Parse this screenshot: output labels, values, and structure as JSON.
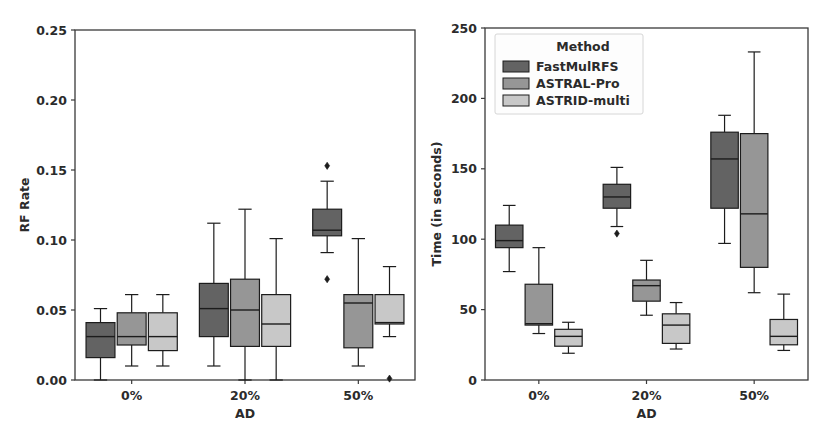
{
  "figure": {
    "width": 827,
    "height": 441,
    "background": "#ffffff",
    "panel_count": 2
  },
  "legend": {
    "title": "Method",
    "position": "upper-left-of-right-panel",
    "entries": [
      {
        "label": "FastMulRFS",
        "color": "#636363"
      },
      {
        "label": "ASTRAL-Pro",
        "color": "#969696"
      },
      {
        "label": "ASTRID-multi",
        "color": "#c8c8c8"
      }
    ]
  },
  "colors": {
    "fastmulrfs": "#636363",
    "astral_pro": "#969696",
    "astrid_multi": "#c8c8c8",
    "edge": "#1c1c1c",
    "axis": "#3a3a3a",
    "text": "#2b2b2b"
  },
  "chart_data": [
    {
      "type": "box",
      "panel": "left",
      "title": "",
      "xlabel": "AD",
      "ylabel": "RF Rate",
      "categories": [
        "0%",
        "20%",
        "50%"
      ],
      "ylim": [
        0.0,
        0.25
      ],
      "yticks": [
        0.0,
        0.05,
        0.1,
        0.15,
        0.2,
        0.25
      ],
      "ytick_labels": [
        "0.00",
        "0.05",
        "0.10",
        "0.15",
        "0.20",
        "0.25"
      ],
      "grid": false,
      "legend_shown": false,
      "series": [
        {
          "name": "FastMulRFS",
          "color": "#636363",
          "boxes": [
            {
              "category": "0%",
              "whisker_low": 0.0,
              "q1": 0.016,
              "median": 0.031,
              "q3": 0.041,
              "whisker_high": 0.051,
              "outliers": []
            },
            {
              "category": "20%",
              "whisker_low": 0.01,
              "q1": 0.031,
              "median": 0.051,
              "q3": 0.069,
              "whisker_high": 0.112,
              "outliers": []
            },
            {
              "category": "50%",
              "whisker_low": 0.091,
              "q1": 0.103,
              "median": 0.107,
              "q3": 0.122,
              "whisker_high": 0.142,
              "outliers": [
                0.153,
                0.072
              ]
            }
          ]
        },
        {
          "name": "ASTRAL-Pro",
          "color": "#969696",
          "boxes": [
            {
              "category": "0%",
              "whisker_low": 0.01,
              "q1": 0.025,
              "median": 0.031,
              "q3": 0.048,
              "whisker_high": 0.061,
              "outliers": []
            },
            {
              "category": "20%",
              "whisker_low": 0.0,
              "q1": 0.024,
              "median": 0.05,
              "q3": 0.072,
              "whisker_high": 0.122,
              "outliers": []
            },
            {
              "category": "50%",
              "whisker_low": 0.01,
              "q1": 0.023,
              "median": 0.055,
              "q3": 0.061,
              "whisker_high": 0.101,
              "outliers": []
            }
          ]
        },
        {
          "name": "ASTRID-multi",
          "color": "#c8c8c8",
          "boxes": [
            {
              "category": "0%",
              "whisker_low": 0.01,
              "q1": 0.021,
              "median": 0.031,
              "q3": 0.048,
              "whisker_high": 0.061,
              "outliers": []
            },
            {
              "category": "20%",
              "whisker_low": 0.0,
              "q1": 0.024,
              "median": 0.04,
              "q3": 0.061,
              "whisker_high": 0.101,
              "outliers": []
            },
            {
              "category": "50%",
              "whisker_low": 0.031,
              "q1": 0.04,
              "median": 0.041,
              "q3": 0.061,
              "whisker_high": 0.081,
              "outliers": [
                0.001
              ]
            }
          ]
        }
      ]
    },
    {
      "type": "box",
      "panel": "right",
      "title": "",
      "xlabel": "AD",
      "ylabel": "Time (in seconds)",
      "categories": [
        "0%",
        "20%",
        "50%"
      ],
      "ylim": [
        0,
        250
      ],
      "yticks": [
        0,
        50,
        100,
        150,
        200,
        250
      ],
      "ytick_labels": [
        "0",
        "50",
        "100",
        "150",
        "200",
        "250"
      ],
      "grid": false,
      "legend_shown": true,
      "series": [
        {
          "name": "FastMulRFS",
          "color": "#636363",
          "boxes": [
            {
              "category": "0%",
              "whisker_low": 77,
              "q1": 94,
              "median": 99,
              "q3": 110,
              "whisker_high": 124,
              "outliers": []
            },
            {
              "category": "20%",
              "whisker_low": 109,
              "q1": 122,
              "median": 130,
              "q3": 139,
              "whisker_high": 151,
              "outliers": [
                104
              ]
            },
            {
              "category": "50%",
              "whisker_low": 97,
              "q1": 122,
              "median": 157,
              "q3": 176,
              "whisker_high": 188,
              "outliers": []
            }
          ]
        },
        {
          "name": "ASTRAL-Pro",
          "color": "#969696",
          "boxes": [
            {
              "category": "0%",
              "whisker_low": 33,
              "q1": 39,
              "median": 40,
              "q3": 68,
              "whisker_high": 94,
              "outliers": []
            },
            {
              "category": "20%",
              "whisker_low": 46,
              "q1": 56,
              "median": 67,
              "q3": 71,
              "whisker_high": 85,
              "outliers": []
            },
            {
              "category": "50%",
              "whisker_low": 62,
              "q1": 80,
              "median": 118,
              "q3": 175,
              "whisker_high": 233,
              "outliers": []
            }
          ]
        },
        {
          "name": "ASTRID-multi",
          "color": "#c8c8c8",
          "boxes": [
            {
              "category": "0%",
              "whisker_low": 19,
              "q1": 24,
              "median": 31,
              "q3": 36,
              "whisker_high": 41,
              "outliers": []
            },
            {
              "category": "20%",
              "whisker_low": 22,
              "q1": 26,
              "median": 39,
              "q3": 47,
              "whisker_high": 55,
              "outliers": []
            },
            {
              "category": "50%",
              "whisker_low": 21,
              "q1": 25,
              "median": 31,
              "q3": 43,
              "whisker_high": 61,
              "outliers": []
            }
          ]
        }
      ]
    }
  ]
}
